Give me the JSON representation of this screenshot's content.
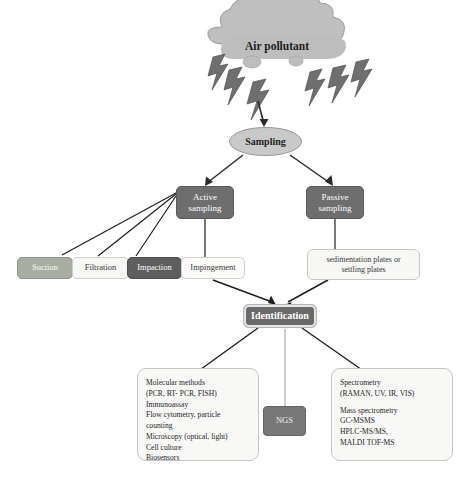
{
  "diagram": {
    "source": {
      "icon": "cloud-icon",
      "label": "Air pollutant",
      "bolts": "lightning-bolt-icon",
      "bolt_count": 6
    },
    "sampling_node": {
      "label": "Sampling",
      "shape": "ellipse",
      "color": "#c9c9c9"
    },
    "branches": [
      {
        "id": "active",
        "label": "Active\nsampling",
        "line1": "Active",
        "line2": "sampling",
        "color": "#6e6e6e"
      },
      {
        "id": "passive",
        "label": "Passive\nsampling",
        "line1": "Passive",
        "line2": "sampling",
        "color": "#6e6e6e"
      }
    ],
    "active_methods": [
      {
        "id": "suction",
        "label": "Suction",
        "color": "#a9aea3",
        "text_color": "#fafafa"
      },
      {
        "id": "filtration",
        "label": "Filtration",
        "color": "#f7f7f5",
        "text_color": "#3a3a3a"
      },
      {
        "id": "impaction",
        "label": "Impaction",
        "color": "#5e5e5e",
        "text_color": "#ffffff"
      },
      {
        "id": "impingement",
        "label": "Impingement",
        "color": "#fbfbf9",
        "text_color": "#3a3a3a"
      }
    ],
    "passive_methods": {
      "line1": "sedimentation plates or",
      "line2": "settling plates"
    },
    "identification": {
      "label": "Identification",
      "color": "#6a6a6a"
    },
    "outputs": {
      "molecular": {
        "lines": [
          "Molecular methods",
          "(PCR, RT- PCR, FISH)",
          "Immunoassay",
          "Flow cytometry, particle",
          "counting",
          "Microscopy (optical, light)",
          "Cell culture",
          "Biosensors"
        ]
      },
      "ngs": {
        "label": "NGS",
        "color": "#787878"
      },
      "spectrometry": {
        "group_a": [
          "Spectrometry",
          "(RAMAN, UV, IR, VIS)"
        ],
        "group_b": [
          "Mass spectrometry",
          "GC-MSMS",
          "HPLC-MS/MS,",
          "MALDI TOF-MS"
        ]
      }
    }
  }
}
